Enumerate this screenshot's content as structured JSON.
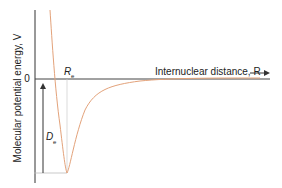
{
  "diagram": {
    "y_axis_label": "Molecular potential energy, V",
    "x_axis_label": "Internuclear distance, R",
    "x_axis_arrow": "→",
    "zero_label": "0",
    "equilibrium_label": "R",
    "equilibrium_subscript": "e",
    "dissociation_label": "D",
    "dissociation_subscript": "e",
    "colors": {
      "curve": "#e3a27a",
      "axis": "#333333",
      "guide": "#bbbbbb"
    }
  }
}
